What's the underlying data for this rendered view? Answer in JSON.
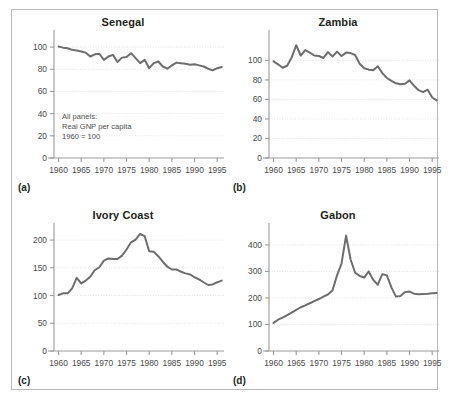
{
  "figure": {
    "note": "All panels:\nReal GNP per capita\n1960 = 100",
    "note_lines": [
      "All panels:",
      "Real GNP per capita",
      "1960 = 100"
    ],
    "line_color": "#6e6e6e",
    "grid_color": "#d7d7d7",
    "axis_color": "#9a9a9a",
    "frame_color": "#b9b9b9",
    "background": "#ffffff",
    "panel_letters": [
      "(a)",
      "(b)",
      "(c)",
      "(d)"
    ]
  },
  "chart_data": [
    {
      "type": "line",
      "title": "Senegal",
      "panel_letter": "(a)",
      "xlabel": "",
      "ylabel": "",
      "xlim": [
        1959,
        1996.5
      ],
      "ylim": [
        0,
        110
      ],
      "yticks": [
        0,
        20,
        40,
        60,
        80,
        100
      ],
      "ytick_labels": [
        "0",
        "20",
        "40",
        "60",
        "80",
        "100"
      ],
      "xticks": [
        1960,
        1965,
        1970,
        1975,
        1980,
        1985,
        1990,
        1995
      ],
      "xtick_labels": [
        "1960",
        "1965",
        "1970",
        "1975",
        "1980",
        "1985",
        "1990",
        "1995"
      ],
      "grid": true,
      "legend": "none",
      "annotation": "All panels:\nReal GNP per capita\n1960 = 100",
      "x": [
        1960,
        1961,
        1962,
        1963,
        1964,
        1965,
        1966,
        1967,
        1968,
        1969,
        1970,
        1971,
        1972,
        1973,
        1974,
        1975,
        1976,
        1977,
        1978,
        1979,
        1980,
        1981,
        1982,
        1983,
        1984,
        1985,
        1986,
        1987,
        1988,
        1989,
        1990,
        1991,
        1992,
        1993,
        1994,
        1995,
        1996
      ],
      "values": [
        100.5,
        99.5,
        99.0,
        97.5,
        97.0,
        96.0,
        95.0,
        91.5,
        93.5,
        94.0,
        88.5,
        91.5,
        93.0,
        86.5,
        90.5,
        91.0,
        94.5,
        90.0,
        85.5,
        88.5,
        81.0,
        85.5,
        87.0,
        82.5,
        80.5,
        83.5,
        86.0,
        85.5,
        85.0,
        84.0,
        84.5,
        83.5,
        82.5,
        80.5,
        79.0,
        81.0,
        82.0
      ]
    },
    {
      "type": "line",
      "title": "Zambia",
      "panel_letter": "(b)",
      "xlabel": "",
      "ylabel": "",
      "xlim": [
        1959,
        1996.5
      ],
      "ylim": [
        0,
        125
      ],
      "yticks": [
        0,
        20,
        40,
        60,
        80,
        100
      ],
      "ytick_labels": [
        "0",
        "20",
        "40",
        "60",
        "80",
        "100"
      ],
      "xticks": [
        1960,
        1965,
        1970,
        1975,
        1980,
        1985,
        1990,
        1995
      ],
      "xtick_labels": [
        "1960",
        "1965",
        "1970",
        "1975",
        "1980",
        "1985",
        "1990",
        "1995"
      ],
      "grid": true,
      "legend": "none",
      "x": [
        1960,
        1961,
        1962,
        1963,
        1964,
        1965,
        1966,
        1967,
        1968,
        1969,
        1970,
        1971,
        1972,
        1973,
        1974,
        1975,
        1976,
        1977,
        1978,
        1979,
        1980,
        1981,
        1982,
        1983,
        1984,
        1985,
        1986,
        1987,
        1988,
        1989,
        1990,
        1991,
        1992,
        1993,
        1994,
        1995,
        1996
      ],
      "values": [
        99.0,
        96.0,
        92.5,
        94.5,
        103.0,
        115.5,
        105.0,
        110.5,
        108.0,
        105.0,
        104.5,
        102.5,
        108.5,
        104.0,
        109.0,
        104.5,
        108.0,
        107.5,
        105.5,
        96.5,
        92.0,
        90.5,
        90.0,
        94.0,
        87.0,
        82.0,
        79.0,
        76.5,
        75.5,
        76.0,
        79.5,
        74.0,
        69.5,
        67.5,
        70.0,
        62.0,
        59.0
      ]
    },
    {
      "type": "line",
      "title": "Ivory Coast",
      "panel_letter": "(c)",
      "xlabel": "",
      "ylabel": "",
      "xlim": [
        1959,
        1996.5
      ],
      "ylim": [
        0,
        220
      ],
      "yticks": [
        0,
        50,
        100,
        150,
        200
      ],
      "ytick_labels": [
        "0",
        "50",
        "100",
        "150",
        "200"
      ],
      "xticks": [
        1960,
        1965,
        1970,
        1975,
        1980,
        1985,
        1990,
        1995
      ],
      "xtick_labels": [
        "1960",
        "1965",
        "1970",
        "1975",
        "1980",
        "1985",
        "1990",
        "1995"
      ],
      "grid": true,
      "legend": "none",
      "x": [
        1960,
        1961,
        1962,
        1963,
        1964,
        1965,
        1966,
        1967,
        1968,
        1969,
        1970,
        1971,
        1972,
        1973,
        1974,
        1975,
        1976,
        1977,
        1978,
        1979,
        1980,
        1981,
        1982,
        1983,
        1984,
        1985,
        1986,
        1987,
        1988,
        1989,
        1990,
        1991,
        1992,
        1993,
        1994,
        1995,
        1996
      ],
      "values": [
        101.0,
        104.0,
        104.0,
        113.0,
        132.0,
        122.0,
        127.0,
        134.0,
        146.0,
        151.0,
        163.0,
        167.0,
        166.0,
        166.0,
        172.0,
        183.0,
        196.0,
        201.0,
        211.0,
        207.0,
        180.0,
        179.0,
        171.0,
        161.0,
        152.0,
        147.0,
        147.0,
        143.0,
        140.0,
        138.0,
        133.0,
        129.0,
        124.0,
        119.0,
        120.0,
        124.0,
        127.0
      ]
    },
    {
      "type": "line",
      "title": "Gabon",
      "panel_letter": "(d)",
      "xlabel": "",
      "ylabel": "",
      "xlim": [
        1959,
        1996.5
      ],
      "ylim": [
        0,
        460
      ],
      "yticks": [
        0,
        100,
        200,
        300,
        400
      ],
      "ytick_labels": [
        "0",
        "100",
        "200",
        "300",
        "400"
      ],
      "xticks": [
        1960,
        1965,
        1970,
        1975,
        1980,
        1985,
        1990,
        1995
      ],
      "xtick_labels": [
        "1960",
        "1965",
        "1970",
        "1975",
        "1980",
        "1985",
        "1990",
        "1995"
      ],
      "grid": true,
      "legend": "none",
      "x": [
        1960,
        1961,
        1962,
        1963,
        1964,
        1965,
        1966,
        1967,
        1968,
        1969,
        1970,
        1971,
        1972,
        1973,
        1974,
        1975,
        1976,
        1977,
        1978,
        1979,
        1980,
        1981,
        1982,
        1983,
        1984,
        1985,
        1986,
        1987,
        1988,
        1989,
        1990,
        1991,
        1992,
        1993,
        1994,
        1995,
        1996
      ],
      "values": [
        106.0,
        118.0,
        126.0,
        135.0,
        145.0,
        155.0,
        165.0,
        172.0,
        180.0,
        188.0,
        196.0,
        205.0,
        213.0,
        228.0,
        285.0,
        330.0,
        435.0,
        345.0,
        295.0,
        283.0,
        277.0,
        300.0,
        268.0,
        250.0,
        290.0,
        285.0,
        240.0,
        205.0,
        207.0,
        222.0,
        224.0,
        216.0,
        214.0,
        215.0,
        216.0,
        218.0,
        219.0
      ]
    }
  ]
}
